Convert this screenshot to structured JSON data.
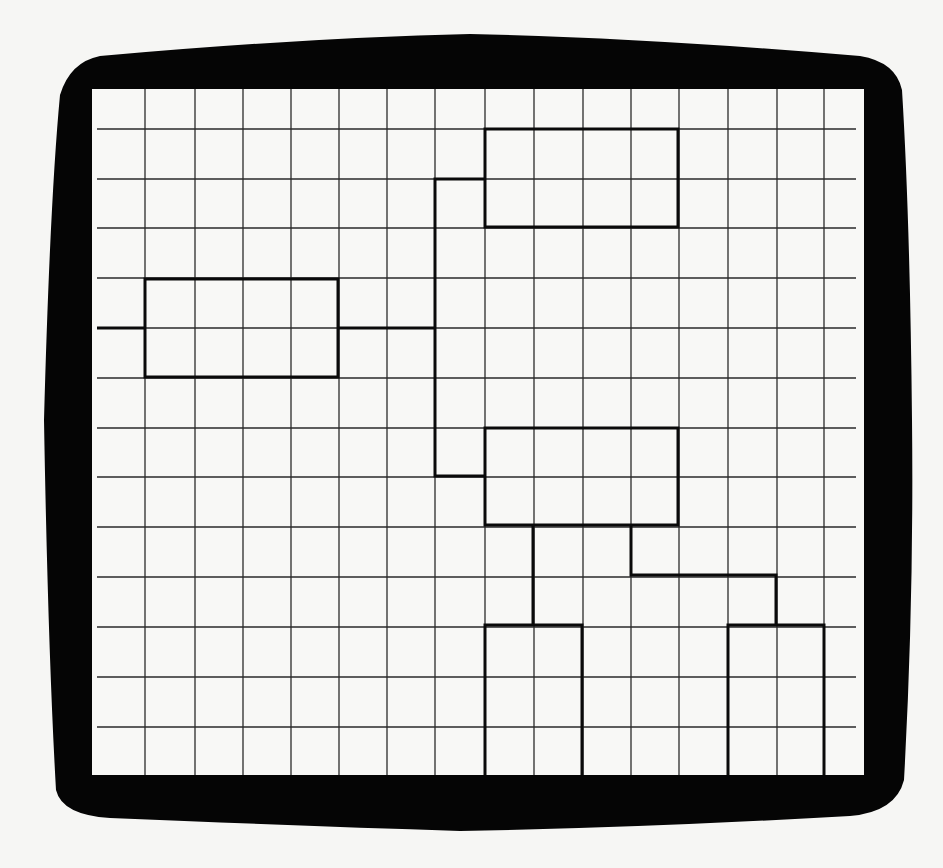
{
  "figure": {
    "title": "Hierarchical block diagram on a grid display",
    "colors": {
      "background": "#f6f6f4",
      "bezel": "#050505",
      "screen": "#f8f8f6",
      "grid_line": "#2a2a2a",
      "diagram_line": "#0a0a0a"
    }
  },
  "screen": {
    "left": 92,
    "top": 89,
    "right": 864,
    "bottom": 775
  },
  "grid": {
    "x_lines": [
      145,
      195,
      243,
      291,
      339,
      387,
      435,
      485,
      534,
      583,
      631,
      679,
      728,
      777,
      824
    ],
    "y_lines": [
      129,
      179,
      228,
      278,
      328,
      378,
      428,
      477,
      527,
      577,
      627,
      677,
      727
    ],
    "h_line_start": 97,
    "h_line_end": 856
  },
  "blocks": [
    {
      "id": "root-block",
      "x": 145,
      "y": 279,
      "w": 193,
      "h": 98,
      "open_bottom": false
    },
    {
      "id": "upper-child-block",
      "x": 485,
      "y": 129,
      "w": 193,
      "h": 98,
      "open_bottom": false
    },
    {
      "id": "lower-child-block",
      "x": 485,
      "y": 428,
      "w": 193,
      "h": 97,
      "open_bottom": false
    },
    {
      "id": "leaf-block-left",
      "x": 485,
      "y": 625,
      "w": 97,
      "h": 150,
      "open_bottom": true
    },
    {
      "id": "leaf-block-right",
      "x": 728,
      "y": 625,
      "w": 96,
      "h": 150,
      "open_bottom": true
    }
  ],
  "connectors": [
    {
      "id": "input-stub",
      "points": [
        [
          97,
          328
        ],
        [
          145,
          328
        ]
      ]
    },
    {
      "id": "root-to-trunk",
      "points": [
        [
          338,
          328
        ],
        [
          435,
          328
        ]
      ]
    },
    {
      "id": "trunk-to-upper",
      "points": [
        [
          435,
          328
        ],
        [
          435,
          179
        ],
        [
          485,
          179
        ]
      ]
    },
    {
      "id": "trunk-to-lower",
      "points": [
        [
          435,
          328
        ],
        [
          435,
          476
        ],
        [
          485,
          476
        ]
      ]
    },
    {
      "id": "lower-to-leaf-left",
      "points": [
        [
          533,
          525
        ],
        [
          533,
          625
        ]
      ]
    },
    {
      "id": "lower-to-leaf-right",
      "points": [
        [
          631,
          525
        ],
        [
          631,
          575
        ],
        [
          776,
          575
        ],
        [
          776,
          625
        ]
      ]
    }
  ]
}
